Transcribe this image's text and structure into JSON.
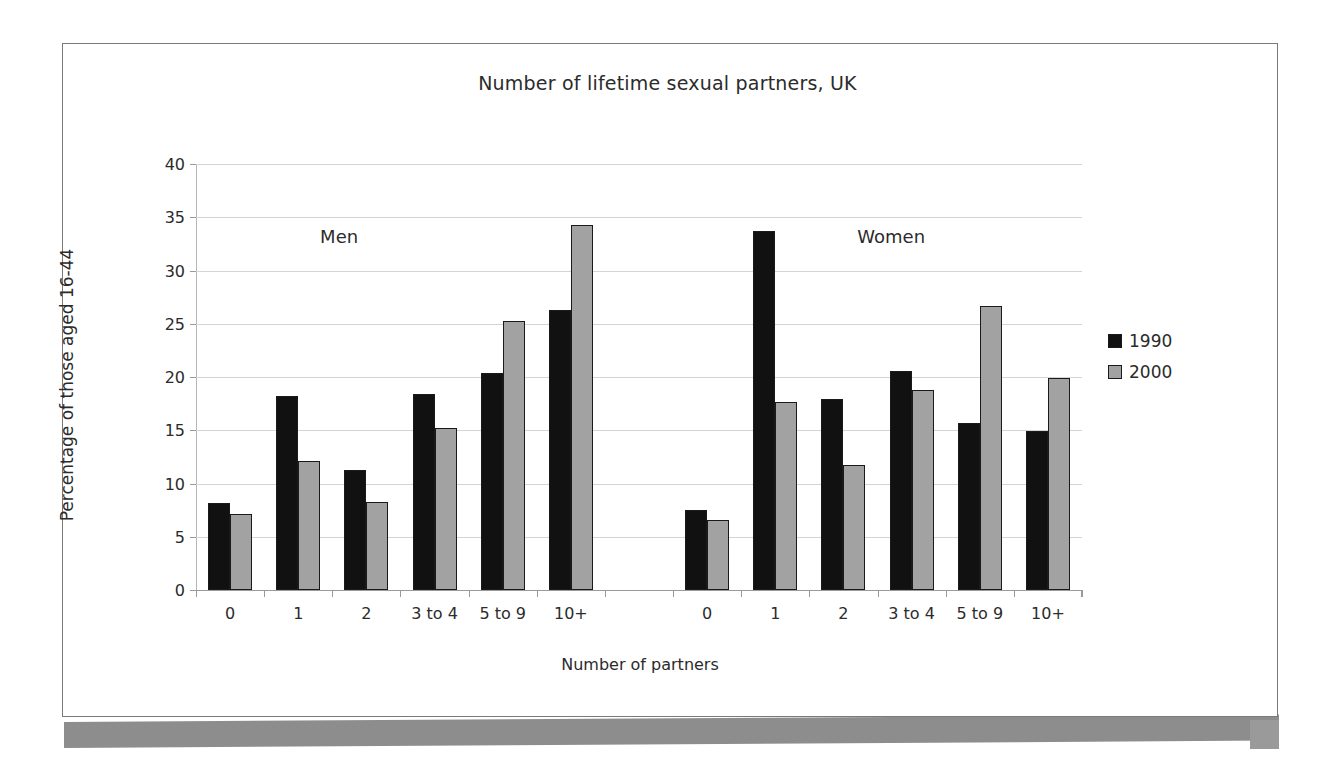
{
  "chart_data": {
    "type": "bar",
    "title": "Number of lifetime sexual partners, UK",
    "xlabel": "Number of partners",
    "ylabel": "Percentage of those aged 16-44",
    "ylim": [
      0,
      40
    ],
    "ytick_step": 5,
    "yticks": [
      "0",
      "5",
      "10",
      "15",
      "20",
      "25",
      "30",
      "35",
      "40"
    ],
    "grid": true,
    "legend_position": "right",
    "legend": [
      "1990",
      "2000"
    ],
    "panels": [
      {
        "name": "Men",
        "categories": [
          "0",
          "1",
          "2",
          "3 to 4",
          "5 to 9",
          "10+"
        ],
        "series": [
          {
            "name": "1990",
            "values": [
              8.2,
              18.2,
              11.3,
              18.4,
              20.4,
              26.3
            ]
          },
          {
            "name": "2000",
            "values": [
              7.1,
              12.1,
              8.3,
              15.2,
              25.3,
              34.3
            ]
          }
        ]
      },
      {
        "name": "Women",
        "categories": [
          "0",
          "1",
          "2",
          "3 to 4",
          "5 to 9",
          "10+"
        ],
        "series": [
          {
            "name": "1990",
            "values": [
              7.5,
              33.7,
              17.9,
              20.6,
              15.7,
              14.9
            ]
          },
          {
            "name": "2000",
            "values": [
              6.6,
              17.7,
              11.7,
              18.8,
              26.7,
              19.9
            ]
          }
        ]
      }
    ],
    "colors": {
      "series_1990": "#111111",
      "series_2000": "#a2a2a2",
      "gridline": "#d4d4d4",
      "axis": "#9a9a9a",
      "text": "#2b2b2b",
      "frame": "#7a7a7a",
      "scan_shadow": "#8d8d8d"
    }
  }
}
